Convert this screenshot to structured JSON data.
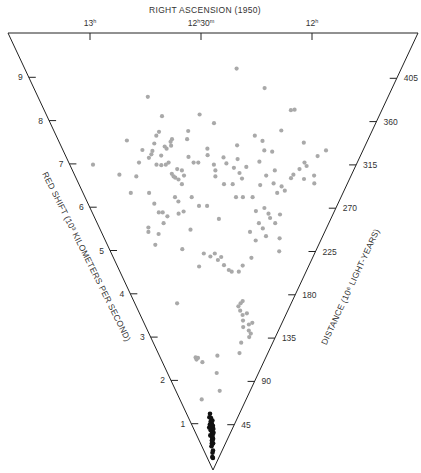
{
  "chart_data": {
    "type": "scatter",
    "title": "RIGHT ASCENSION (1950)",
    "x_axis": {
      "label": "RIGHT ASCENSION (1950)",
      "ticks": [
        {
          "value": 13.0,
          "label_main": "13",
          "label_sup": "h",
          "label_tail": "",
          "label_tail_sup": ""
        },
        {
          "value": 12.5,
          "label_main": "12",
          "label_sup": "h",
          "label_tail": "30",
          "label_tail_sup": "m"
        },
        {
          "value": 12.0,
          "label_main": "12",
          "label_sup": "h",
          "label_tail": "",
          "label_tail_sup": ""
        }
      ],
      "range": [
        13.38,
        11.53
      ]
    },
    "left_axis": {
      "label": "RED SHIFT (10³ KILOMETERS PER SECOND)",
      "ticks": [
        1,
        2,
        3,
        4,
        5,
        6,
        7,
        8,
        9
      ],
      "range": [
        0,
        10
      ]
    },
    "right_axis": {
      "label": "DISTANCE (10⁶ LIGHT-YEARS)",
      "ticks": [
        45,
        90,
        135,
        180,
        225,
        270,
        315,
        360,
        405
      ],
      "range": [
        0,
        450
      ]
    },
    "series": [
      {
        "name": "distant galaxies",
        "color": "#a9a9a9",
        "points": [
          [
            12.33,
            9.27
          ],
          [
            12.79,
            8.62
          ],
          [
            12.18,
            8.82
          ],
          [
            12.73,
            8.17
          ],
          [
            12.44,
            8.01
          ],
          [
            12.52,
            8.21
          ],
          [
            12.0,
            8.32
          ],
          [
            12.02,
            8.31
          ],
          [
            12.59,
            7.83
          ],
          [
            12.6,
            7.64
          ],
          [
            12.76,
            7.81
          ],
          [
            12.78,
            7.72
          ],
          [
            12.96,
            7.61
          ],
          [
            12.88,
            7.39
          ],
          [
            12.69,
            7.64
          ],
          [
            12.7,
            7.58
          ],
          [
            12.73,
            7.42
          ],
          [
            12.74,
            7.47
          ],
          [
            12.7,
            7.49
          ],
          [
            12.8,
            7.54
          ],
          [
            12.82,
            7.37
          ],
          [
            12.85,
            7.21
          ],
          [
            12.83,
            7.29
          ],
          [
            12.77,
            7.26
          ],
          [
            12.92,
            7.1
          ],
          [
            12.81,
            7.05
          ],
          [
            12.78,
            7.04
          ],
          [
            12.73,
            7.1
          ],
          [
            12.75,
            7.05
          ],
          [
            12.68,
            6.95
          ],
          [
            12.65,
            6.92
          ],
          [
            12.7,
            6.75
          ],
          [
            12.71,
            6.78
          ],
          [
            12.72,
            6.84
          ],
          [
            12.68,
            6.71
          ],
          [
            12.64,
            6.8
          ],
          [
            12.66,
            6.6
          ],
          [
            12.72,
            6.3
          ],
          [
            12.7,
            6.2
          ],
          [
            12.9,
            6.4
          ],
          [
            12.96,
            6.78
          ],
          [
            13.07,
            6.82
          ],
          [
            13.03,
            6.4
          ],
          [
            13.22,
            7.05
          ],
          [
            12.88,
            6.15
          ],
          [
            12.86,
            5.95
          ],
          [
            12.97,
            5.6
          ],
          [
            12.98,
            5.5
          ],
          [
            12.83,
            5.95
          ],
          [
            12.8,
            5.86
          ],
          [
            12.71,
            5.92
          ],
          [
            12.67,
            5.97
          ],
          [
            12.63,
            5.55
          ],
          [
            12.95,
            5.2
          ],
          [
            12.84,
            5.7
          ],
          [
            12.57,
            7.1
          ],
          [
            12.48,
            7.42
          ],
          [
            12.48,
            7.27
          ],
          [
            12.6,
            7.23
          ],
          [
            12.54,
            7.1
          ],
          [
            12.36,
            7.08
          ],
          [
            12.38,
            7.22
          ],
          [
            12.43,
            6.78
          ],
          [
            12.43,
            6.92
          ],
          [
            12.37,
            6.6
          ],
          [
            12.31,
            6.6
          ],
          [
            12.27,
            6.86
          ],
          [
            12.25,
            6.73
          ],
          [
            12.23,
            7.0
          ],
          [
            12.15,
            7.12
          ],
          [
            12.12,
            6.58
          ],
          [
            12.09,
            6.8
          ],
          [
            12.04,
            6.92
          ],
          [
            12.03,
            6.62
          ],
          [
            12.06,
            6.05
          ],
          [
            12.02,
            5.92
          ],
          [
            12.0,
            5.82
          ],
          [
            11.99,
            6.4
          ],
          [
            11.91,
            6.82
          ],
          [
            11.92,
            6.74
          ],
          [
            11.88,
            6.95
          ],
          [
            11.84,
            7.02
          ],
          [
            11.83,
            6.72
          ],
          [
            11.75,
            6.62
          ],
          [
            11.77,
            6.8
          ],
          [
            11.97,
            6.55
          ],
          [
            11.94,
            6.45
          ],
          [
            12.28,
            6.3
          ],
          [
            12.23,
            6.3
          ],
          [
            12.55,
            6.1
          ],
          [
            12.6,
            6.3
          ],
          [
            12.49,
            6.1
          ],
          [
            12.4,
            5.8
          ],
          [
            12.16,
            6.3
          ],
          [
            12.12,
            5.98
          ],
          [
            12.08,
            5.7
          ],
          [
            12.13,
            7.38
          ],
          [
            12.08,
            7.35
          ],
          [
            12.15,
            7.6
          ],
          [
            12.29,
            7.18
          ],
          [
            12.3,
            7.5
          ],
          [
            12.31,
            6.98
          ],
          [
            12.44,
            7.05
          ],
          [
            12.2,
            7.72
          ],
          [
            12.05,
            7.84
          ],
          [
            11.86,
            7.1
          ],
          [
            11.79,
            7.25
          ],
          [
            11.9,
            7.56
          ],
          [
            11.75,
            7.38
          ],
          [
            11.93,
            5.9
          ],
          [
            11.95,
            5.7
          ],
          [
            11.88,
            5.35
          ],
          [
            11.85,
            5.05
          ],
          [
            12.53,
            5.0
          ],
          [
            12.47,
            4.93
          ],
          [
            12.58,
            4.7
          ],
          [
            12.4,
            4.85
          ],
          [
            12.43,
            5.0
          ],
          [
            12.37,
            4.92
          ],
          [
            12.34,
            4.73
          ],
          [
            12.29,
            4.62
          ],
          [
            12.26,
            4.58
          ],
          [
            12.19,
            4.58
          ],
          [
            12.16,
            4.72
          ],
          [
            12.09,
            4.9
          ],
          [
            12.08,
            5.3
          ],
          [
            12.14,
            5.5
          ],
          [
            12.0,
            5.4
          ],
          [
            12.04,
            5.58
          ],
          [
            12.12,
            3.85
          ],
          [
            12.1,
            3.9
          ],
          [
            12.14,
            3.78
          ],
          [
            12.11,
            3.68
          ],
          [
            12.07,
            3.58
          ],
          [
            12.02,
            3.62
          ],
          [
            12.05,
            3.45
          ],
          [
            11.92,
            3.4
          ],
          [
            11.94,
            3.22
          ],
          [
            11.9,
            3.15
          ],
          [
            11.91,
            3.07
          ],
          [
            11.96,
            3.36
          ],
          [
            12.01,
            2.94
          ],
          [
            12.0,
            2.7
          ],
          [
            12.87,
            3.85
          ],
          [
            12.75,
            2.6
          ],
          [
            12.74,
            2.55
          ],
          [
            12.71,
            2.59
          ],
          [
            12.64,
            2.49
          ],
          [
            12.37,
            2.64
          ],
          [
            12.37,
            2.24
          ],
          [
            12.28,
            1.83
          ],
          [
            12.76,
            1.63
          ],
          [
            12.9,
            5.45
          ],
          [
            12.72,
            5.1
          ],
          [
            12.03,
            3.3
          ]
        ]
      },
      {
        "name": "Virgo cluster",
        "color": "#111111",
        "points": [
          [
            12.55,
            1.3
          ],
          [
            12.52,
            1.2
          ],
          [
            12.58,
            1.22
          ],
          [
            12.54,
            1.12
          ],
          [
            12.5,
            1.08
          ],
          [
            12.47,
            1.14
          ],
          [
            12.45,
            1.02
          ],
          [
            12.49,
            0.96
          ],
          [
            12.53,
            0.98
          ],
          [
            12.51,
            0.9
          ],
          [
            12.48,
            0.88
          ],
          [
            12.46,
            0.82
          ],
          [
            12.52,
            0.8
          ],
          [
            12.5,
            0.75
          ],
          [
            12.47,
            0.7
          ],
          [
            12.44,
            0.72
          ],
          [
            12.42,
            0.86
          ],
          [
            12.56,
            0.92
          ],
          [
            12.6,
            0.8
          ],
          [
            12.62,
            0.98
          ],
          [
            12.49,
            0.6
          ],
          [
            12.53,
            0.62
          ],
          [
            12.57,
            0.55
          ],
          [
            12.45,
            0.45
          ],
          [
            12.5,
            0.4
          ],
          [
            12.55,
            0.3
          ],
          [
            12.46,
            0.28
          ],
          [
            12.43,
            0.95
          ],
          [
            12.58,
            1.05
          ],
          [
            12.51,
            1.03
          ],
          [
            12.48,
            0.77
          ],
          [
            12.52,
            0.68
          ],
          [
            12.44,
            0.62
          ]
        ]
      }
    ]
  }
}
